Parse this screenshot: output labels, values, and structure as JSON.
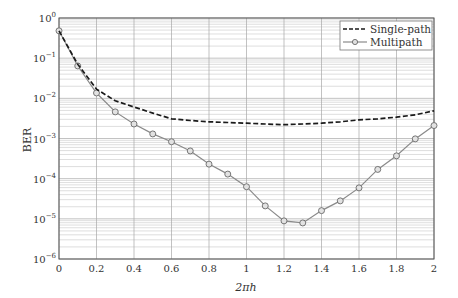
{
  "chart_data": {
    "type": "line",
    "title": "",
    "xlabel": "2πh",
    "ylabel": "BER",
    "xlim": [
      0,
      2
    ],
    "ylim": [
      1e-06,
      1
    ],
    "yscale": "log",
    "grid": true,
    "minor_grid": true,
    "legend_position": "upper right",
    "x_ticks": [
      0,
      0.2,
      0.4,
      0.6,
      0.8,
      1,
      1.2,
      1.4,
      1.6,
      1.8,
      2
    ],
    "x_tick_labels": [
      "0",
      "0.2",
      "0.4",
      "0.6",
      "0.8",
      "1",
      "1.2",
      "1.4",
      "1.6",
      "1.8",
      "2"
    ],
    "y_ticks": [
      1,
      0.1,
      0.01,
      0.001,
      0.0001,
      1e-05,
      1e-06
    ],
    "y_tick_labels": [
      {
        "base": "10",
        "exp": "0"
      },
      {
        "base": "10",
        "exp": "−1"
      },
      {
        "base": "10",
        "exp": "−2"
      },
      {
        "base": "10",
        "exp": "−3"
      },
      {
        "base": "10",
        "exp": "−4"
      },
      {
        "base": "10",
        "exp": "−5"
      },
      {
        "base": "10",
        "exp": "−6"
      }
    ],
    "series": [
      {
        "name": "Single-path",
        "style": "dashed",
        "color": "#1a1a1a",
        "marker": "none",
        "x": [
          0,
          0.1,
          0.2,
          0.3,
          0.4,
          0.5,
          0.6,
          0.7,
          0.8,
          0.9,
          1.0,
          1.1,
          1.2,
          1.3,
          1.4,
          1.5,
          1.6,
          1.7,
          1.8,
          1.9,
          2.0
        ],
        "values": [
          0.48,
          0.07,
          0.017,
          0.0087,
          0.0061,
          0.0043,
          0.0031,
          0.0028,
          0.0026,
          0.0025,
          0.0024,
          0.0023,
          0.0022,
          0.0023,
          0.0024,
          0.0026,
          0.0029,
          0.0031,
          0.0034,
          0.0039,
          0.0049
        ]
      },
      {
        "name": "Multipath",
        "style": "solid",
        "color": "#8a8a8a",
        "marker": "circle",
        "x": [
          0,
          0.1,
          0.2,
          0.3,
          0.4,
          0.5,
          0.6,
          0.7,
          0.8,
          0.9,
          1.0,
          1.1,
          1.2,
          1.3,
          1.4,
          1.5,
          1.6,
          1.7,
          1.8,
          1.9,
          2.0
        ],
        "values": [
          0.48,
          0.064,
          0.0136,
          0.0046,
          0.0023,
          0.0013,
          0.00083,
          0.00049,
          0.00023,
          0.00013,
          6.3e-05,
          2.1e-05,
          8.9e-06,
          7.9e-06,
          1.6e-05,
          2.8e-05,
          5.9e-05,
          0.00017,
          0.00037,
          0.00098,
          0.0021
        ]
      }
    ]
  }
}
